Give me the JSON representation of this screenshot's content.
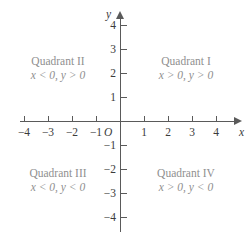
{
  "figure": {
    "type": "coordinate-plane"
  },
  "axes": {
    "x_label": "x",
    "y_label": "y",
    "origin_label": "O",
    "x_ticks": [
      -4,
      -3,
      -2,
      -1,
      1,
      2,
      3,
      4
    ],
    "y_ticks": [
      4,
      3,
      2,
      1,
      -1,
      -2,
      -3,
      -4
    ],
    "x_tick_labels": [
      "−4",
      "−3",
      "−2",
      "−1",
      "1",
      "2",
      "3",
      "4"
    ],
    "y_tick_labels": [
      "4",
      "3",
      "2",
      "1",
      "−1",
      "−2",
      "−3",
      "−4"
    ],
    "x_range": [
      -4.5,
      4.5
    ],
    "y_range": [
      -4.5,
      4.5
    ],
    "unit_px": 24,
    "axis_color": "#5a5a5a",
    "label_color": "#3b3b3b"
  },
  "quadrants": [
    {
      "id": "quadrant-1",
      "title": "Quadrant I",
      "condition": "x > 0, y > 0",
      "x_sign": "positive",
      "y_sign": "positive"
    },
    {
      "id": "quadrant-2",
      "title": "Quadrant II",
      "condition": "x < 0, y > 0",
      "x_sign": "negative",
      "y_sign": "positive"
    },
    {
      "id": "quadrant-3",
      "title": "Quadrant III",
      "condition": "x < 0, y < 0",
      "x_sign": "negative",
      "y_sign": "negative"
    },
    {
      "id": "quadrant-4",
      "title": "Quadrant IV",
      "condition": "x > 0, y < 0",
      "x_sign": "positive",
      "y_sign": "negative"
    }
  ],
  "colors": {
    "background": "#ffffff",
    "axis": "#5a5a5a",
    "tick_text": "#3b3b3b",
    "quadrant_text": "#8f8f8f"
  }
}
